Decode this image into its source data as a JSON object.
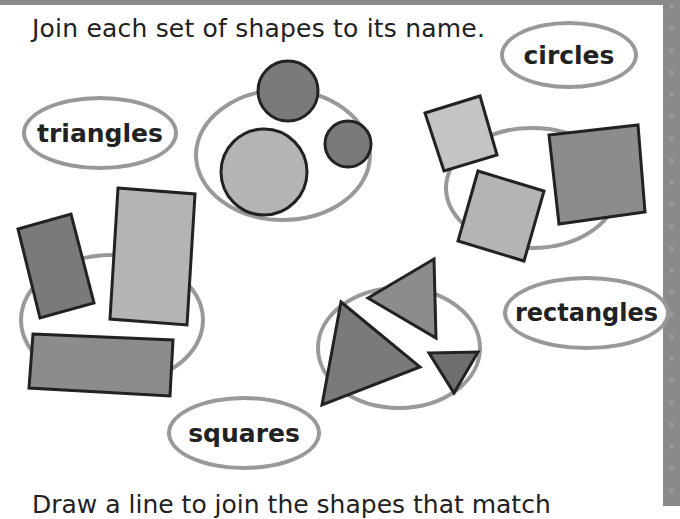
{
  "instruction": "Join each set of shapes to its name.",
  "bottom_instruction": "Draw a line to join the shapes that match",
  "labels": [
    {
      "id": "triangles",
      "text": "triangles"
    },
    {
      "id": "circles",
      "text": "circles"
    },
    {
      "id": "rectangles",
      "text": "rectangles"
    },
    {
      "id": "squares",
      "text": "squares"
    }
  ],
  "shape_groups": [
    {
      "name": "circles-group",
      "count": 3
    },
    {
      "name": "squares-group",
      "count": 3
    },
    {
      "name": "rectangles-group",
      "count": 3
    },
    {
      "name": "triangles-group",
      "count": 3
    }
  ],
  "colors": {
    "outline": "#999999",
    "shape_dark": "#7a7a7a",
    "shape_mid": "#8c8c8c",
    "shape_light": "#b4b4b4",
    "stroke": "#222222"
  }
}
